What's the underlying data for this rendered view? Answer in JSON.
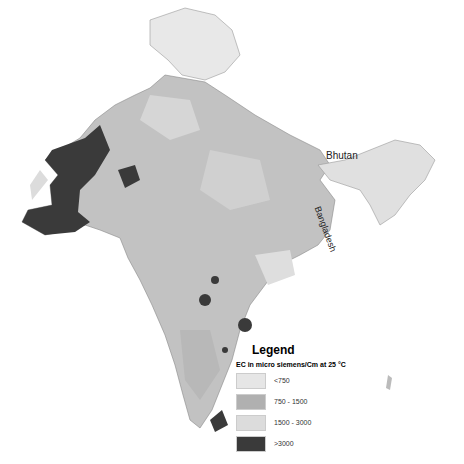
{
  "map": {
    "labels": {
      "bhutan": "Bhutan",
      "bangladesh": "Bangladesh"
    }
  },
  "legend": {
    "title": "Legend",
    "subtitle": "EC in micro siemens/Cm at 25 °C",
    "items": [
      {
        "label": "<750",
        "color": "#e6e6e6"
      },
      {
        "label": "750 - 1500",
        "color": "#b0b0b0"
      },
      {
        "label": "1500 - 3000",
        "color": "#dcdcdc"
      },
      {
        "label": ">3000",
        "color": "#3a3a3a"
      }
    ]
  }
}
